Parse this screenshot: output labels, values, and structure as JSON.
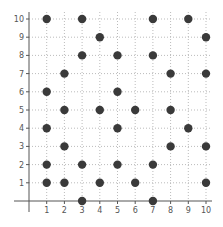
{
  "chart_data": {
    "type": "scatter",
    "title": "",
    "xlabel": "",
    "ylabel": "",
    "xlim": [
      -1,
      10
    ],
    "ylim": [
      -1,
      10
    ],
    "grid": true,
    "legend": null,
    "x_ticks": [
      1,
      2,
      3,
      4,
      5,
      6,
      7,
      8,
      9,
      10
    ],
    "y_ticks": [
      1,
      2,
      3,
      4,
      5,
      6,
      7,
      8,
      9,
      10
    ],
    "series": [
      {
        "name": "points",
        "color": "#3a3a3a",
        "points": [
          [
            1,
            10
          ],
          [
            3,
            10
          ],
          [
            7,
            10
          ],
          [
            9,
            10
          ],
          [
            4,
            9
          ],
          [
            10,
            9
          ],
          [
            3,
            8
          ],
          [
            5,
            8
          ],
          [
            7,
            8
          ],
          [
            2,
            7
          ],
          [
            8,
            7
          ],
          [
            10,
            7
          ],
          [
            1,
            6
          ],
          [
            5,
            6
          ],
          [
            2,
            5
          ],
          [
            4,
            5
          ],
          [
            6,
            5
          ],
          [
            8,
            5
          ],
          [
            1,
            4
          ],
          [
            5,
            4
          ],
          [
            9,
            4
          ],
          [
            2,
            3
          ],
          [
            8,
            3
          ],
          [
            10,
            3
          ],
          [
            1,
            2
          ],
          [
            3,
            2
          ],
          [
            5,
            2
          ],
          [
            7,
            2
          ],
          [
            1,
            1
          ],
          [
            2,
            1
          ],
          [
            4,
            1
          ],
          [
            6,
            1
          ],
          [
            10,
            1
          ],
          [
            3,
            0
          ],
          [
            7,
            0
          ]
        ]
      }
    ]
  },
  "colors": {
    "axis": "#555555",
    "grid": "#bbbbbb",
    "marker": "#3a3a3a"
  }
}
